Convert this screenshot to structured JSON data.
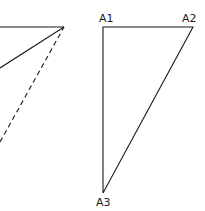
{
  "diagram": {
    "left_figure": {
      "apex": [
        64,
        27
      ],
      "lines": [
        {
          "name": "top-line",
          "from": [
            0,
            27
          ],
          "to": [
            64,
            27
          ],
          "style": "solid"
        },
        {
          "name": "diagonal-solid",
          "from": [
            0,
            68
          ],
          "to": [
            64,
            27
          ],
          "style": "solid"
        },
        {
          "name": "diagonal-dashed",
          "from": [
            0,
            142
          ],
          "to": [
            64,
            27
          ],
          "style": "dashed"
        }
      ]
    },
    "right_triangle": {
      "vertices": {
        "A1": [
          103,
          27
        ],
        "A2": [
          193,
          27
        ],
        "A3": [
          103,
          193
        ]
      },
      "labels": {
        "a1": "A1",
        "a2": "A2",
        "a3": "A3"
      }
    },
    "colors": {
      "stroke": "#1a1a1a",
      "background": "#ffffff"
    }
  }
}
